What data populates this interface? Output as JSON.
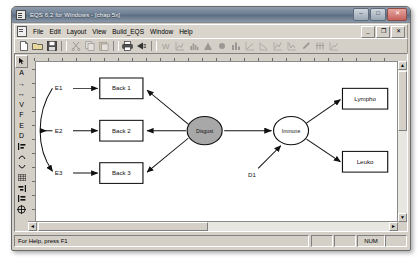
{
  "window": {
    "title": "EQS 6.2 for Windows - [chap 5x]",
    "icon": "app-icon",
    "buttons": [
      {
        "name": "minimize",
        "glyph": "–"
      },
      {
        "name": "maximize",
        "glyph": "□"
      },
      {
        "name": "close",
        "glyph": "✕"
      }
    ]
  },
  "menubar": {
    "doc_icon": "document-icon",
    "items": [
      {
        "label": "File",
        "accel": "F"
      },
      {
        "label": "Edit",
        "accel": "E"
      },
      {
        "label": "Layout",
        "accel": "L"
      },
      {
        "label": "View",
        "accel": "V"
      },
      {
        "label": "Build_EQS",
        "accel": "B"
      },
      {
        "label": "Window",
        "accel": "W"
      },
      {
        "label": "Help",
        "accel": "H"
      }
    ],
    "mdi_buttons": [
      {
        "name": "mdi-minimize",
        "glyph": "_"
      },
      {
        "name": "mdi-restore",
        "glyph": "❐"
      },
      {
        "name": "mdi-close",
        "glyph": "✕"
      }
    ]
  },
  "toolbar": {
    "items": [
      {
        "name": "new-icon",
        "enabled": true
      },
      {
        "name": "open-icon",
        "enabled": true
      },
      {
        "name": "save-icon",
        "enabled": true
      },
      {
        "name": "separator",
        "enabled": false
      },
      {
        "name": "cut-icon",
        "enabled": false
      },
      {
        "name": "copy-icon",
        "enabled": false
      },
      {
        "name": "paste-icon",
        "enabled": false
      },
      {
        "name": "separator",
        "enabled": false
      },
      {
        "name": "print-icon",
        "enabled": true
      },
      {
        "name": "print-preview-icon",
        "enabled": true
      },
      {
        "name": "separator",
        "enabled": false
      },
      {
        "name": "wizard-icon",
        "enabled": false
      },
      {
        "name": "regression-plot-icon",
        "enabled": false
      },
      {
        "name": "histogram-icon",
        "enabled": false
      },
      {
        "name": "distribution-icon",
        "enabled": false
      },
      {
        "name": "point-icon",
        "enabled": false
      },
      {
        "name": "bar-chart-icon",
        "enabled": false
      },
      {
        "name": "scatter-plot-icon",
        "enabled": false
      },
      {
        "name": "scatter-plot2-icon",
        "enabled": false
      },
      {
        "name": "line-plot-icon",
        "enabled": false
      },
      {
        "name": "line-plot2-icon",
        "enabled": false
      },
      {
        "name": "edit-model-icon",
        "enabled": false
      },
      {
        "name": "run-icon",
        "enabled": false
      },
      {
        "name": "results-icon",
        "enabled": false
      }
    ]
  },
  "palette": {
    "items": [
      {
        "name": "pointer-tool",
        "glyph": "↖",
        "selected": true
      },
      {
        "name": "text-tool",
        "glyph": "A",
        "selected": false
      },
      {
        "name": "one-way-arrow-tool",
        "glyph": "→",
        "selected": false
      },
      {
        "name": "two-way-arrow-tool",
        "glyph": "↔",
        "selected": false
      },
      {
        "name": "variance-tool",
        "glyph": "V",
        "selected": false
      },
      {
        "name": "factor-tool",
        "glyph": "F",
        "selected": false
      },
      {
        "name": "error-tool",
        "glyph": "E",
        "selected": false
      },
      {
        "name": "disturbance-tool",
        "glyph": "D",
        "selected": false
      },
      {
        "name": "align-tool",
        "glyph": "⊣",
        "selected": false
      },
      {
        "name": "curve-left-tool",
        "glyph": "⌢",
        "selected": false
      },
      {
        "name": "curve-right-tool",
        "glyph": "⌣",
        "selected": false
      },
      {
        "name": "grid-tool",
        "glyph": "▦",
        "selected": false
      },
      {
        "name": "snap-tool",
        "glyph": "⊢",
        "selected": false
      },
      {
        "name": "group-tool",
        "glyph": "⊣",
        "selected": false
      },
      {
        "name": "center-tool",
        "glyph": "⊕",
        "selected": false
      }
    ]
  },
  "diagram": {
    "measured_variables": [
      {
        "name": "box-back1",
        "label": "Back 1",
        "error": "E1"
      },
      {
        "name": "box-back2",
        "label": "Back 2",
        "error": "E2"
      },
      {
        "name": "box-back3",
        "label": "Back 3",
        "error": "E3"
      }
    ],
    "right_variables": [
      {
        "name": "box-lympho",
        "label": "Lympho",
        "error": "E4"
      },
      {
        "name": "box-leuko",
        "label": "Leuko",
        "error": "E5"
      }
    ],
    "factors": [
      {
        "name": "factor-disgust",
        "label": "Disgust",
        "shaded": true
      },
      {
        "name": "factor-immune",
        "label": "Immune",
        "shaded": false
      }
    ],
    "disturbance": "D1"
  },
  "statusbar": {
    "help_text": "For Help, press F1",
    "indicators": [
      "",
      "",
      "NUM",
      ""
    ]
  },
  "scrollbars": {
    "up": "▲",
    "down": "▼",
    "left": "◄",
    "right": "►"
  },
  "colors": {
    "titlebar": "#6f7f93",
    "face": "#d4d0c8",
    "client": "#87888a",
    "canvas": "#ffffff",
    "factor_shaded": "#a8a8a8",
    "ink": "#000000"
  }
}
